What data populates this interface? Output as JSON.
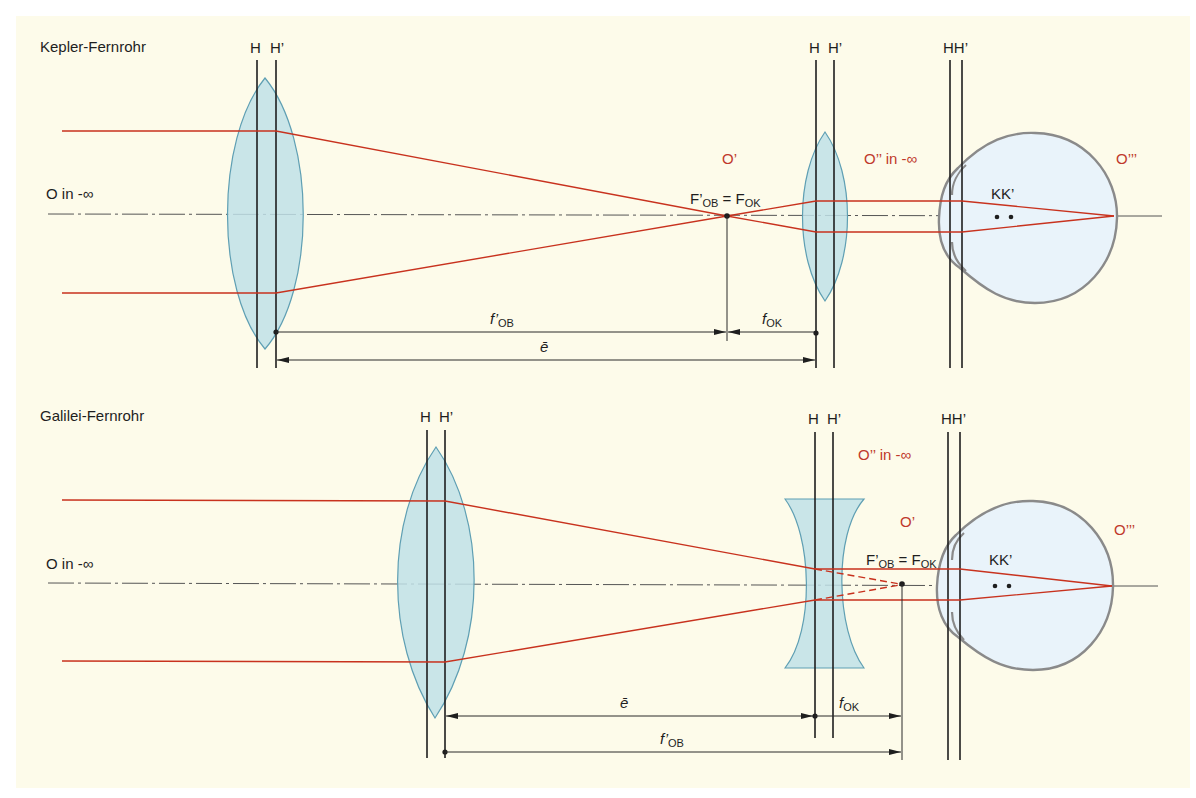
{
  "colors": {
    "background_panel": "#fdfbea",
    "ray": "#c8321e",
    "lens": "#bfe0e8",
    "lens_stroke": "#5f9fb3",
    "eye": "#e9f3fa",
    "label_red": "#c0392b"
  },
  "kepler": {
    "title": "Kepler-Fernrohr",
    "object_label": "O in -∞",
    "objective_h": "H",
    "objective_h_prime": "H’",
    "eyepiece_h": "H",
    "eyepiece_h_prime": "H’",
    "eye_hh": "HH’",
    "intermediate_image": "O’",
    "focus_label_main_1": "F’",
    "focus_label_sub_1": "OB",
    "focus_label_eq": " = F",
    "focus_label_sub_2": "OK",
    "virtual_image": "O’’ in -∞",
    "retina_image": "O’’’",
    "nodal_points": "KK’",
    "dim_fob_main": "f’",
    "dim_fob_sub": "OB",
    "dim_fok_main": "f",
    "dim_fok_sub": "OK",
    "dim_e": "ē"
  },
  "galilei": {
    "title": "Galilei-Fernrohr",
    "object_label": "O in -∞",
    "objective_h": "H",
    "objective_h_prime": "H’",
    "eyepiece_h": "H",
    "eyepiece_h_prime": "H’",
    "eye_hh": "HH’",
    "intermediate_image": "O’",
    "focus_label_main_1": "F’",
    "focus_label_sub_1": "OB",
    "focus_label_eq": " = F",
    "focus_label_sub_2": "OK",
    "virtual_image": "O’’ in -∞",
    "retina_image": "O’’’",
    "nodal_points": "KK’",
    "dim_fob_main": "f’",
    "dim_fob_sub": "OB",
    "dim_fok_main": "f",
    "dim_fok_sub": "OK",
    "dim_e": "ē"
  }
}
